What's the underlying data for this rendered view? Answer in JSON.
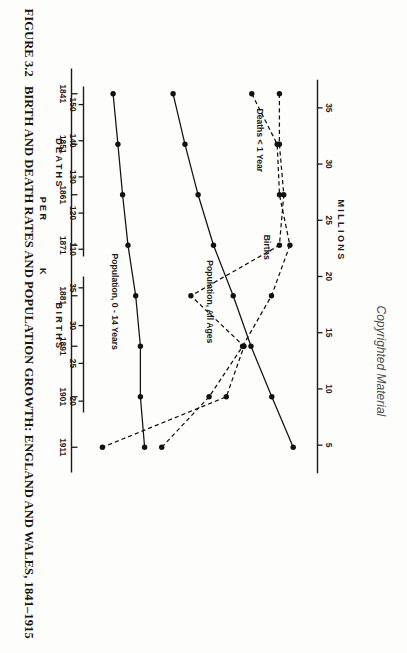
{
  "page": {
    "caption_number": "FIGURE 3.2",
    "caption_text": "BIRTH AND DEATH RATES AND POPULATION GROWTH: ENGLAND AND WALES, 1841–1915",
    "copyright_notice": "Copyrighted Material"
  },
  "chart_data": {
    "type": "line",
    "title": "BIRTH AND DEATH RATES AND POPULATION GROWTH: ENGLAND AND WALES, 1841–1915",
    "xlabel": "",
    "x": [
      1841,
      1851,
      1861,
      1871,
      1881,
      1891,
      1901,
      1911
    ],
    "x_tick_labels": [
      "1841",
      "1851",
      "1861",
      "1871",
      "1881",
      "1891",
      "1901",
      "1911"
    ],
    "xlim": [
      1836,
      1916
    ],
    "grid": false,
    "legend_position": "inline-annotations",
    "axes": [
      {
        "id": "millions",
        "name": "MILLIONS",
        "position": "top",
        "ticks": [
          35,
          30,
          25,
          20,
          15,
          10,
          5
        ],
        "tick_labels": [
          "35",
          "30",
          "25",
          "20",
          "15",
          "10",
          "5"
        ],
        "lim": [
          2.5,
          37.5
        ]
      },
      {
        "id": "deaths",
        "name": "DEATHS",
        "sub_name": "PER",
        "position": "bottom-left",
        "ticks": [
          150,
          140,
          130,
          120,
          110
        ],
        "tick_labels": [
          "150",
          "140",
          "130",
          "120",
          "110"
        ],
        "lim": [
          108,
          155
        ]
      },
      {
        "id": "births",
        "name": "BIRTHS",
        "sub_name": "K",
        "position": "bottom-right",
        "ticks": [
          35,
          30,
          25,
          20
        ],
        "tick_labels": [
          "35",
          "30",
          "25",
          "20"
        ],
        "lim": [
          18.5,
          36.5
        ]
      }
    ],
    "series": [
      {
        "name": "Population, All Ages",
        "axis": "millions",
        "linestyle": "solid",
        "marker": "circle",
        "color": "#111111",
        "values": [
          15.9,
          17.9,
          20.1,
          22.7,
          26.0,
          29.0,
          32.5,
          36.1
        ]
      },
      {
        "name": "Population, 0 - 14 Years",
        "axis": "millions",
        "linestyle": "solid",
        "marker": "circle",
        "color": "#111111",
        "values": [
          5.8,
          6.6,
          7.4,
          8.3,
          9.6,
          10.4,
          10.4,
          11.1
        ]
      },
      {
        "name": "Deaths < 1 Year",
        "axis": "deaths",
        "linestyle": "dashed",
        "marker": "circle",
        "color": "#111111",
        "values": [
          150,
          150,
          151,
          150,
          130,
          142,
          138,
          110
        ]
      },
      {
        "name": "Births",
        "axis": "births",
        "linestyle": "dashed",
        "marker": "circle",
        "color": "#111111",
        "values": [
          32.2,
          34.4,
          34.6,
          35.5,
          33.9,
          31.4,
          28.5,
          24.4
        ]
      }
    ]
  }
}
